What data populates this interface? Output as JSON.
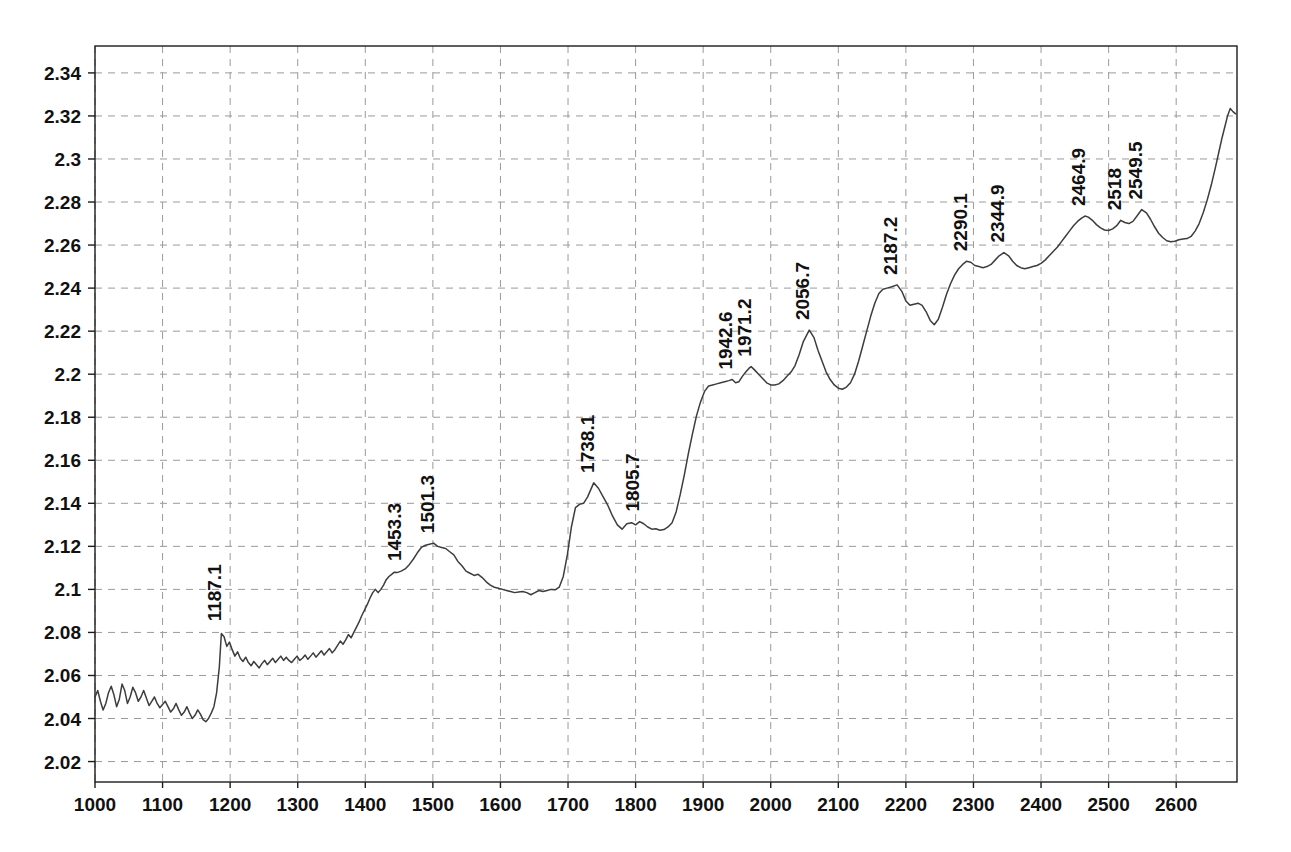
{
  "chart_data": {
    "type": "line",
    "title": "",
    "subtitle": "",
    "xlabel": "",
    "ylabel": "",
    "xlim": [
      1000,
      2690
    ],
    "ylim": [
      2.0105,
      2.3525
    ],
    "grid": true,
    "legend": false,
    "legend_position": "none",
    "line_color": "#3d3d3d",
    "grid_color": "#9a9a9a",
    "axis_color": "#1c1c1c",
    "background_color": "#ffffff",
    "xticks": [
      1000,
      1100,
      1200,
      1300,
      1400,
      1500,
      1600,
      1700,
      1800,
      1900,
      2000,
      2100,
      2200,
      2300,
      2400,
      2500,
      2600
    ],
    "xtick_labels": [
      "1000",
      "1100",
      "1200",
      "1300",
      "1400",
      "1500",
      "1600",
      "1700",
      "1800",
      "1900",
      "2000",
      "2100",
      "2200",
      "2300",
      "2400",
      "2500",
      "2600"
    ],
    "yticks": [
      2.02,
      2.04,
      2.06,
      2.08,
      2.1,
      2.12,
      2.14,
      2.16,
      2.18,
      2.2,
      2.22,
      2.24,
      2.26,
      2.28,
      2.3,
      2.32,
      2.34
    ],
    "ytick_labels": [
      "2.02",
      "2.04",
      "2.06",
      "2.08",
      "2.1",
      "2.12",
      "2.14",
      "2.16",
      "2.18",
      "2.2",
      "2.22",
      "2.24",
      "2.26",
      "2.28",
      "2.3",
      "2.32",
      "2.34"
    ],
    "annotations": [
      {
        "label": "1187.1",
        "x": 1187.1,
        "y": 2.0805
      },
      {
        "label": "1453.3",
        "x": 1453.3,
        "y": 2.1085
      },
      {
        "label": "1501.3",
        "x": 1501.3,
        "y": 2.1215
      },
      {
        "label": "1738.1",
        "x": 1738.1,
        "y": 2.1495
      },
      {
        "label": "1805.7",
        "x": 1805.7,
        "y": 2.1315
      },
      {
        "label": "1942.6",
        "x": 1942.6,
        "y": 2.1975
      },
      {
        "label": "1971.2",
        "x": 1971.2,
        "y": 2.2035
      },
      {
        "label": "2056.7",
        "x": 2056.7,
        "y": 2.2205
      },
      {
        "label": "2187.2",
        "x": 2187.2,
        "y": 2.2415
      },
      {
        "label": "2290.1",
        "x": 2290.1,
        "y": 2.2525
      },
      {
        "label": "2344.9",
        "x": 2344.9,
        "y": 2.2565
      },
      {
        "label": "2464.9",
        "x": 2464.9,
        "y": 2.2735
      },
      {
        "label": "2518",
        "x": 2518.0,
        "y": 2.2715
      },
      {
        "label": "2549.5",
        "x": 2549.5,
        "y": 2.2765
      }
    ],
    "x": [
      1000,
      1004,
      1008,
      1012,
      1016,
      1020,
      1024,
      1028,
      1032,
      1036,
      1040,
      1044,
      1048,
      1052,
      1056,
      1060,
      1064,
      1068,
      1072,
      1076,
      1080,
      1084,
      1088,
      1092,
      1096,
      1100,
      1104,
      1108,
      1112,
      1116,
      1120,
      1124,
      1128,
      1132,
      1136,
      1140,
      1144,
      1148,
      1152,
      1156,
      1160,
      1164,
      1168,
      1172,
      1176,
      1180,
      1184,
      1187,
      1191,
      1195,
      1199,
      1203,
      1207,
      1211,
      1215,
      1219,
      1223,
      1227,
      1231,
      1235,
      1239,
      1243,
      1247,
      1251,
      1255,
      1259,
      1263,
      1267,
      1271,
      1275,
      1279,
      1283,
      1287,
      1291,
      1295,
      1299,
      1303,
      1307,
      1311,
      1315,
      1319,
      1323,
      1327,
      1331,
      1335,
      1339,
      1343,
      1347,
      1351,
      1355,
      1359,
      1363,
      1367,
      1371,
      1375,
      1379,
      1383,
      1387,
      1391,
      1395,
      1399,
      1403,
      1407,
      1411,
      1415,
      1419,
      1423,
      1427,
      1431,
      1435,
      1439,
      1443,
      1447,
      1453,
      1459,
      1465,
      1471,
      1477,
      1483,
      1489,
      1495,
      1501,
      1507,
      1513,
      1519,
      1525,
      1531,
      1537,
      1543,
      1549,
      1555,
      1561,
      1567,
      1573,
      1579,
      1585,
      1591,
      1597,
      1603,
      1609,
      1615,
      1621,
      1627,
      1633,
      1639,
      1645,
      1651,
      1657,
      1663,
      1669,
      1675,
      1681,
      1687,
      1693,
      1699,
      1705,
      1711,
      1717,
      1723,
      1729,
      1738,
      1745,
      1752,
      1759,
      1766,
      1773,
      1780,
      1787,
      1794,
      1800,
      1806,
      1812,
      1818,
      1824,
      1830,
      1836,
      1842,
      1848,
      1854,
      1860,
      1866,
      1872,
      1878,
      1884,
      1890,
      1896,
      1902,
      1908,
      1914,
      1920,
      1926,
      1932,
      1938,
      1943,
      1948,
      1953,
      1958,
      1963,
      1968,
      1971,
      1976,
      1982,
      1988,
      1994,
      2000,
      2006,
      2012,
      2018,
      2024,
      2030,
      2036,
      2042,
      2048,
      2057,
      2064,
      2070,
      2076,
      2082,
      2088,
      2094,
      2100,
      2106,
      2112,
      2118,
      2124,
      2130,
      2136,
      2142,
      2148,
      2154,
      2160,
      2166,
      2172,
      2178,
      2187,
      2194,
      2200,
      2206,
      2212,
      2218,
      2224,
      2230,
      2236,
      2242,
      2248,
      2254,
      2260,
      2266,
      2272,
      2278,
      2284,
      2290,
      2296,
      2302,
      2308,
      2314,
      2320,
      2326,
      2332,
      2338,
      2345,
      2352,
      2358,
      2364,
      2370,
      2376,
      2382,
      2388,
      2394,
      2400,
      2406,
      2412,
      2418,
      2424,
      2430,
      2436,
      2442,
      2448,
      2454,
      2460,
      2465,
      2470,
      2476,
      2482,
      2488,
      2494,
      2500,
      2506,
      2512,
      2518,
      2524,
      2530,
      2536,
      2542,
      2549,
      2556,
      2562,
      2568,
      2574,
      2580,
      2586,
      2592,
      2598,
      2604,
      2610,
      2616,
      2622,
      2628,
      2634,
      2640,
      2646,
      2652,
      2658,
      2663,
      2668,
      2672,
      2676,
      2680,
      2684,
      2688
    ],
    "y": [
      2.05,
      2.053,
      2.048,
      2.044,
      2.047,
      2.052,
      2.055,
      2.051,
      2.0455,
      2.049,
      2.056,
      2.053,
      2.047,
      2.05,
      2.0545,
      2.052,
      2.048,
      2.05,
      2.053,
      2.0495,
      2.046,
      2.048,
      2.05,
      2.047,
      2.045,
      2.0465,
      2.048,
      2.0455,
      2.043,
      2.0445,
      2.047,
      2.044,
      2.0415,
      2.043,
      2.0455,
      2.0425,
      2.04,
      2.0415,
      2.044,
      2.042,
      2.0395,
      2.0385,
      2.04,
      2.0425,
      2.0455,
      2.052,
      2.064,
      2.0795,
      2.078,
      2.0735,
      2.0755,
      2.072,
      2.069,
      2.071,
      2.068,
      2.0665,
      2.0685,
      2.066,
      2.0645,
      2.0665,
      2.065,
      2.0635,
      2.0655,
      2.067,
      2.065,
      2.0665,
      2.068,
      2.066,
      2.0675,
      2.069,
      2.067,
      2.0685,
      2.067,
      2.066,
      2.0675,
      2.069,
      2.067,
      2.068,
      2.0695,
      2.0675,
      2.069,
      2.0705,
      2.0685,
      2.07,
      2.0715,
      2.0695,
      2.071,
      2.0725,
      2.0705,
      2.072,
      2.074,
      2.076,
      2.0745,
      2.0765,
      2.079,
      2.0775,
      2.08,
      2.0825,
      2.085,
      2.088,
      2.0905,
      2.093,
      2.096,
      2.0985,
      2.1,
      2.0985,
      2.1,
      2.102,
      2.1045,
      2.106,
      2.107,
      2.108,
      2.1078,
      2.1085,
      2.1095,
      2.1115,
      2.114,
      2.117,
      2.1195,
      2.1205,
      2.121,
      2.1215,
      2.12,
      2.1195,
      2.119,
      2.1175,
      2.116,
      2.113,
      2.111,
      2.1085,
      2.1075,
      2.1065,
      2.107,
      2.1055,
      2.1035,
      2.102,
      2.101,
      2.1005,
      2.1,
      2.0995,
      2.099,
      2.0985,
      2.0988,
      2.099,
      2.0985,
      2.0975,
      2.0985,
      2.0995,
      2.099,
      2.0995,
      2.1,
      2.0998,
      2.101,
      2.106,
      2.116,
      2.129,
      2.138,
      2.1395,
      2.14,
      2.143,
      2.1495,
      2.147,
      2.143,
      2.139,
      2.134,
      2.13,
      2.128,
      2.1305,
      2.131,
      2.13,
      2.1315,
      2.1305,
      2.129,
      2.128,
      2.1282,
      2.1275,
      2.1278,
      2.129,
      2.131,
      2.136,
      2.144,
      2.153,
      2.163,
      2.172,
      2.1805,
      2.187,
      2.192,
      2.1945,
      2.195,
      2.1955,
      2.196,
      2.1965,
      2.197,
      2.1975,
      2.196,
      2.1965,
      2.199,
      2.201,
      2.2028,
      2.2035,
      2.202,
      2.2,
      2.198,
      2.196,
      2.195,
      2.195,
      2.1955,
      2.197,
      2.199,
      2.201,
      2.204,
      2.209,
      2.215,
      2.2205,
      2.217,
      2.211,
      2.206,
      2.201,
      2.1975,
      2.195,
      2.1935,
      2.193,
      2.194,
      2.196,
      2.2,
      2.206,
      2.213,
      2.22,
      2.227,
      2.233,
      2.2375,
      2.2395,
      2.24,
      2.2405,
      2.2415,
      2.2385,
      2.234,
      2.232,
      2.2325,
      2.233,
      2.232,
      2.229,
      2.225,
      2.223,
      2.2255,
      2.231,
      2.237,
      2.242,
      2.246,
      2.249,
      2.251,
      2.2525,
      2.252,
      2.2505,
      2.25,
      2.2495,
      2.25,
      2.251,
      2.253,
      2.255,
      2.2565,
      2.255,
      2.2525,
      2.2505,
      2.2495,
      2.249,
      2.2495,
      2.25,
      2.2505,
      2.2515,
      2.253,
      2.255,
      2.257,
      2.259,
      2.2615,
      2.264,
      2.2665,
      2.269,
      2.271,
      2.2725,
      2.2735,
      2.273,
      2.2715,
      2.2695,
      2.268,
      2.267,
      2.2668,
      2.2675,
      2.269,
      2.2715,
      2.2705,
      2.27,
      2.271,
      2.2735,
      2.2765,
      2.275,
      2.272,
      2.2685,
      2.2655,
      2.2635,
      2.262,
      2.2615,
      2.2618,
      2.2625,
      2.2628,
      2.263,
      2.264,
      2.2665,
      2.27,
      2.275,
      2.281,
      2.288,
      2.296,
      2.303,
      2.31,
      2.315,
      2.32,
      2.3235,
      2.322,
      2.321
    ]
  }
}
